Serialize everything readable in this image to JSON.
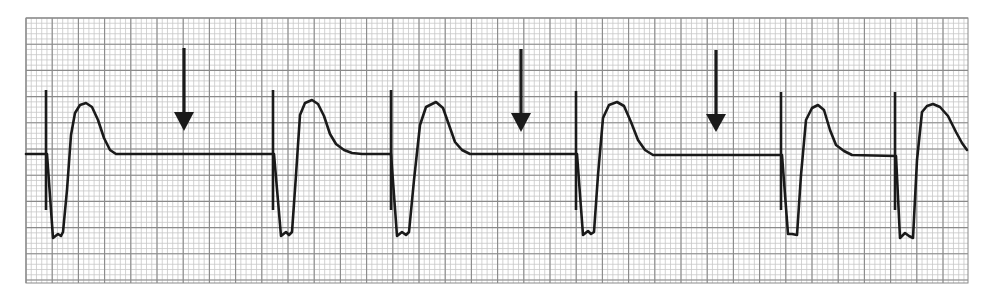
{
  "chart_data": {
    "type": "line",
    "title": "",
    "subtitle": "",
    "xlabel": "",
    "ylabel": "",
    "legend": [],
    "description": "ECG rhythm strip on grid paper: six wide complexes (tall narrow spike, deep notched negative deflection, broad rounded T-wave) with three downward arrows marking pauses in the baseline.",
    "grid": {
      "on": true,
      "x0": 26,
      "y0": 18,
      "x1": 968,
      "y1": 283,
      "minor_spacing": 5.24,
      "major_spacing": 26.2,
      "minor_color": "#c8c8c8",
      "major_color": "#8a8a8a",
      "background": "#ffffff"
    },
    "trace": {
      "color": "#1a1a1a",
      "width": 2.6,
      "baseline_y": 154,
      "segments": [
        [
          [
            26,
            154
          ],
          [
            46,
            154
          ]
        ],
        [
          [
            47,
            154
          ],
          [
            53,
            238
          ],
          [
            58,
            234
          ],
          [
            61,
            236
          ],
          [
            63,
            232
          ],
          [
            67,
            190
          ],
          [
            71,
            135
          ],
          [
            75,
            113
          ],
          [
            80,
            105
          ],
          [
            86,
            103
          ],
          [
            92,
            107
          ],
          [
            98,
            120
          ],
          [
            104,
            138
          ],
          [
            110,
            150
          ],
          [
            116,
            154
          ],
          [
            273,
            154
          ]
        ],
        [
          [
            274,
            154
          ],
          [
            281,
            236
          ],
          [
            286,
            232
          ],
          [
            289,
            235
          ],
          [
            292,
            232
          ],
          [
            296,
            175
          ],
          [
            300,
            115
          ],
          [
            305,
            103
          ],
          [
            312,
            100
          ],
          [
            318,
            104
          ],
          [
            324,
            116
          ],
          [
            330,
            134
          ],
          [
            336,
            144
          ],
          [
            344,
            150
          ],
          [
            352,
            153
          ],
          [
            362,
            154
          ],
          [
            390,
            154
          ]
        ],
        [
          [
            391,
            154
          ],
          [
            397,
            236
          ],
          [
            402,
            232
          ],
          [
            406,
            235
          ],
          [
            409,
            232
          ],
          [
            414,
            180
          ],
          [
            420,
            125
          ],
          [
            426,
            107
          ],
          [
            436,
            102
          ],
          [
            443,
            108
          ],
          [
            449,
            125
          ],
          [
            455,
            142
          ],
          [
            462,
            150
          ],
          [
            470,
            154
          ],
          [
            576,
            154
          ]
        ],
        [
          [
            577,
            154
          ],
          [
            583,
            235
          ],
          [
            588,
            231
          ],
          [
            591,
            234
          ],
          [
            594,
            232
          ],
          [
            598,
            175
          ],
          [
            603,
            118
          ],
          [
            609,
            105
          ],
          [
            617,
            102
          ],
          [
            624,
            106
          ],
          [
            631,
            122
          ],
          [
            638,
            140
          ],
          [
            645,
            150
          ],
          [
            653,
            155
          ],
          [
            781,
            155
          ]
        ],
        [
          [
            782,
            155
          ],
          [
            788,
            234
          ],
          [
            792,
            234
          ],
          [
            797,
            235
          ],
          [
            801,
            175
          ],
          [
            806,
            120
          ],
          [
            812,
            108
          ],
          [
            818,
            105
          ],
          [
            824,
            110
          ],
          [
            830,
            130
          ],
          [
            836,
            145
          ],
          [
            844,
            151
          ],
          [
            852,
            155
          ],
          [
            895,
            156
          ]
        ],
        [
          [
            896,
            156
          ],
          [
            900,
            238
          ],
          [
            905,
            233
          ],
          [
            909,
            236
          ],
          [
            913,
            238
          ],
          [
            917,
            160
          ],
          [
            922,
            112
          ],
          [
            927,
            106
          ],
          [
            933,
            104
          ],
          [
            940,
            107
          ],
          [
            948,
            116
          ],
          [
            956,
            132
          ],
          [
            962,
            143
          ],
          [
            967,
            150
          ]
        ]
      ],
      "r_spikes": [
        {
          "x": 46,
          "top": 90,
          "bottom": 210
        },
        {
          "x": 273,
          "top": 90,
          "bottom": 210
        },
        {
          "x": 391,
          "top": 90,
          "bottom": 210
        },
        {
          "x": 576,
          "top": 91,
          "bottom": 210
        },
        {
          "x": 781,
          "top": 92,
          "bottom": 210
        },
        {
          "x": 895,
          "top": 92,
          "bottom": 210
        }
      ]
    },
    "annotations": {
      "arrows": [
        {
          "label": "pause-arrow-1",
          "x": 184,
          "shaft_top": 48,
          "head_top": 112,
          "tip": 131,
          "head_half_width": 10
        },
        {
          "label": "pause-arrow-2",
          "x": 521,
          "shaft_top": 49,
          "head_top": 113,
          "tip": 132,
          "head_half_width": 10
        },
        {
          "label": "pause-arrow-3",
          "x": 716,
          "shaft_top": 50,
          "head_top": 114,
          "tip": 132,
          "head_half_width": 10
        }
      ],
      "arrow_color": "#1a1a1a"
    },
    "complex_count": 6,
    "pause_count": 3
  }
}
